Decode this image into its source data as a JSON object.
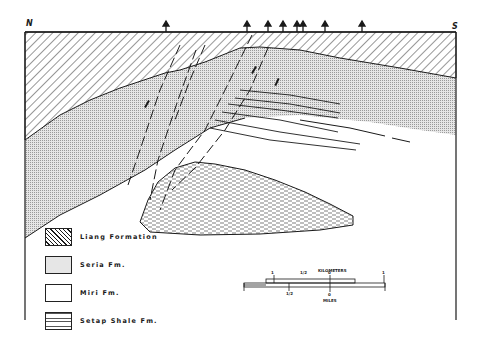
{
  "section": {
    "left_direction": "N",
    "right_direction": "S",
    "well_count": 8
  },
  "legend": {
    "items": [
      {
        "label": "Liang Formation",
        "pattern": "diagonal-hatch"
      },
      {
        "label": "Seria Fm.",
        "pattern": "fine-stipple"
      },
      {
        "label": "Miri Fm.",
        "pattern": "blank"
      },
      {
        "label": "Setap Shale Fm.",
        "pattern": "dashed-shale"
      }
    ]
  },
  "scale_bar": {
    "top_label": "KILOMETERS",
    "bottom_label": "MILES",
    "top_ticks": [
      "1",
      "1/2",
      "0",
      "1"
    ],
    "bottom_ticks": [
      "1/2",
      "0"
    ]
  },
  "colors": {
    "line": "#1a1a1a",
    "stipple": "#bdbdbd",
    "background": "#ffffff"
  }
}
